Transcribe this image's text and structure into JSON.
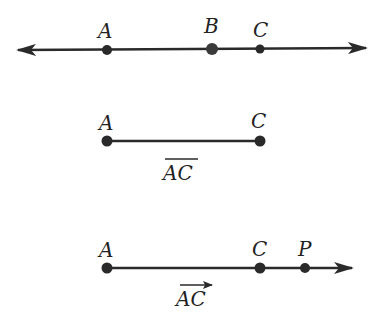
{
  "diagram": {
    "line": {
      "points": [
        {
          "label": "A",
          "x": 107
        },
        {
          "label": "B",
          "x": 212
        },
        {
          "label": "C",
          "x": 260
        }
      ]
    },
    "segment": {
      "points": [
        {
          "label": "A",
          "x": 107
        },
        {
          "label": "C",
          "x": 260
        }
      ],
      "name": "AC",
      "notation": "overbar"
    },
    "ray": {
      "points": [
        {
          "label": "A",
          "x": 107
        },
        {
          "label": "C",
          "x": 260
        },
        {
          "label": "P",
          "x": 305
        }
      ],
      "name": "AC",
      "notation": "arrow"
    },
    "colors": {
      "stroke": "#2a2a2a",
      "point": "#2a2a2a"
    }
  }
}
